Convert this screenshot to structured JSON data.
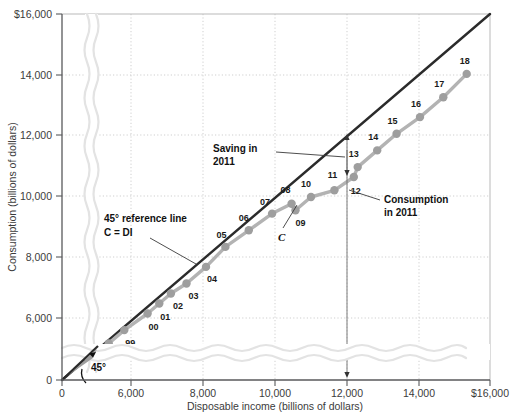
{
  "chart_data": {
    "type": "scatter",
    "title": "",
    "xlabel": "Disposable income (billions of dollars)",
    "ylabel": "Consumption (billions of dollars)",
    "xlim": [
      5000,
      16000
    ],
    "ylim": [
      5000,
      16000
    ],
    "x_ticks": [
      "0",
      "6,000",
      "8,000",
      "10,000",
      "12,000",
      "14,000",
      "$16,000"
    ],
    "x_tick_values": [
      0,
      6000,
      8000,
      10000,
      12000,
      14000,
      16000
    ],
    "y_ticks": [
      "0",
      "6,000",
      "8,000",
      "10,000",
      "12,000",
      "14,000",
      "$16,000"
    ],
    "y_tick_values": [
      0,
      6000,
      8000,
      10000,
      12000,
      14000,
      16000
    ],
    "grid": true,
    "axis_break": true,
    "legend_position": "none",
    "series": [
      {
        "name": "C",
        "kind": "scatter-with-line",
        "color": "#9e9e9e",
        "points": [
          {
            "label": "98",
            "x": 6200,
            "y": 6100,
            "label_dx": -8,
            "label_dy": 18
          },
          {
            "label": "99",
            "x": 6600,
            "y": 6500,
            "label_dx": 6,
            "label_dy": 16
          },
          {
            "label": "00",
            "x": 7200,
            "y": 7000,
            "label_dx": 6,
            "label_dy": 16
          },
          {
            "label": "01",
            "x": 7500,
            "y": 7300,
            "label_dx": 6,
            "label_dy": 16
          },
          {
            "label": "02",
            "x": 7800,
            "y": 7600,
            "label_dx": 7,
            "label_dy": 15
          },
          {
            "label": "03",
            "x": 8200,
            "y": 7900,
            "label_dx": 7,
            "label_dy": 15
          },
          {
            "label": "04",
            "x": 8700,
            "y": 8400,
            "label_dx": 6,
            "label_dy": 15
          },
          {
            "label": "05",
            "x": 9200,
            "y": 9000,
            "label_dx": -4,
            "label_dy": -9
          },
          {
            "label": "06",
            "x": 9800,
            "y": 9500,
            "label_dx": -5,
            "label_dy": -9
          },
          {
            "label": "07",
            "x": 10400,
            "y": 10000,
            "label_dx": -7,
            "label_dy": -9
          },
          {
            "label": "08",
            "x": 10900,
            "y": 10300,
            "label_dx": -6,
            "label_dy": -11
          },
          {
            "label": "09",
            "x": 11000,
            "y": 10100,
            "label_dx": 5,
            "label_dy": 16
          },
          {
            "label": "10",
            "x": 11400,
            "y": 10500,
            "label_dx": -5,
            "label_dy": -10
          },
          {
            "label": "11",
            "x": 12000,
            "y": 10700,
            "label_dx": -2,
            "label_dy": -12
          },
          {
            "label": "12",
            "x": 12500,
            "y": 11100,
            "label_dx": 2,
            "label_dy": 17
          },
          {
            "label": "13",
            "x": 12600,
            "y": 11400,
            "label_dx": -4,
            "label_dy": -10
          },
          {
            "label": "14",
            "x": 13100,
            "y": 11900,
            "label_dx": -4,
            "label_dy": -10
          },
          {
            "label": "15",
            "x": 13600,
            "y": 12400,
            "label_dx": -4,
            "label_dy": -10
          },
          {
            "label": "16",
            "x": 14200,
            "y": 12900,
            "label_dx": -4,
            "label_dy": -10
          },
          {
            "label": "17",
            "x": 14800,
            "y": 13500,
            "label_dx": -4,
            "label_dy": -10
          },
          {
            "label": "18",
            "x": 15400,
            "y": 14200,
            "label_dx": -2,
            "label_dy": -10
          }
        ]
      },
      {
        "name": "45-degree reference line",
        "kind": "line",
        "color": "#2b2b2b",
        "equation": "C = DI",
        "from": {
          "x": 5000,
          "y": 5000
        },
        "to": {
          "x": 16000,
          "y": 16000
        }
      }
    ],
    "annotations": [
      {
        "id": "saving-2011",
        "text_line1": "Saving in",
        "text_line2": "2011",
        "points_to_x": 12000,
        "points_to_y": 11350
      },
      {
        "id": "reference-line",
        "text_line1": "45° reference line",
        "text_line2": "C = DI",
        "points_to_x": 8400,
        "points_to_y": 8400
      },
      {
        "id": "c-curve",
        "text_line1": "C",
        "points_to_x": 10100,
        "points_to_y": 9700
      },
      {
        "id": "consumption-2011",
        "text_line1": "Consumption",
        "text_line2": "in 2011",
        "points_to_x": 12000,
        "points_to_y": 10700
      },
      {
        "id": "angle-45",
        "text_line1": "45°"
      }
    ]
  },
  "figure": {
    "y_axis_title": "Consumption (billions of dollars)",
    "x_axis_title": "Disposable income (billions of dollars)",
    "origin_x_label": "0",
    "origin_y_label": "0",
    "angle_label": "45°",
    "saving_label_1": "Saving in",
    "saving_label_2": "2011",
    "ref_label_1": "45° reference line",
    "ref_label_2": "C = DI",
    "c_label": "C",
    "consumption_label_1": "Consumption",
    "consumption_label_2": "in 2011"
  }
}
